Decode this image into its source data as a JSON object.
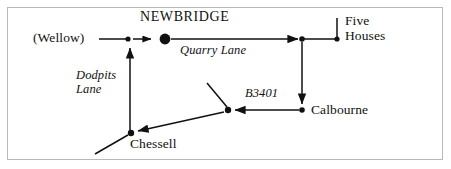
{
  "figure": {
    "border_color": "#b9b9b9",
    "ink_color": "#111111",
    "background_color": "#ffffff"
  },
  "places": {
    "wellow": "(Wellow)",
    "newbridge": "NEWBRIDGE",
    "five_houses_line1": "Five",
    "five_houses_line2": "Houses",
    "calbourne": "Calbourne",
    "chessell": "Chessell"
  },
  "roads": {
    "quarry_lane": "Quarry Lane",
    "dodpits_lane_line1": "Dodpits",
    "dodpits_lane_line2": "Lane",
    "b3401": "B3401"
  },
  "nodes": [
    {
      "name": "dodpits-junction",
      "x": 128,
      "y": 39,
      "r": 2.6
    },
    {
      "name": "newbridge-village",
      "x": 165,
      "y": 39,
      "r": 5.4
    },
    {
      "name": "five-houses-junction",
      "x": 302,
      "y": 39,
      "r": 2.8
    },
    {
      "name": "five-houses-terminus",
      "x": 337,
      "y": 39,
      "r": 2.6
    },
    {
      "name": "calbourne-node",
      "x": 302,
      "y": 111,
      "r": 2.8
    },
    {
      "name": "b3401-junction",
      "x": 228,
      "y": 110,
      "r": 3.0
    },
    {
      "name": "chessell-node",
      "x": 131,
      "y": 133,
      "r": 3.0
    }
  ],
  "edges": [
    {
      "name": "wellow-to-dodpits-junction",
      "from": "wellow-label",
      "to": "dodpits-junction",
      "arrow": false
    },
    {
      "name": "dodpits-junction-to-newbridge",
      "from": "dodpits-junction",
      "to": "newbridge-village",
      "arrow": true
    },
    {
      "name": "newbridge-to-five-houses-junction",
      "from": "newbridge-village",
      "to": "five-houses-junction",
      "arrow": true,
      "label": "Quarry Lane"
    },
    {
      "name": "five-houses-junction-to-terminus",
      "from": "five-houses-junction",
      "to": "five-houses-terminus",
      "arrow": false
    },
    {
      "name": "five-houses-terminus-tick",
      "from": "five-houses-terminus",
      "to": "tick-above",
      "arrow": false
    },
    {
      "name": "five-houses-junction-to-calbourne",
      "from": "five-houses-junction",
      "to": "calbourne-node",
      "arrow": true
    },
    {
      "name": "calbourne-to-b3401-junction",
      "from": "calbourne-node",
      "to": "b3401-junction",
      "arrow": true,
      "label": "B3401"
    },
    {
      "name": "b3401-junction-spur-north",
      "from": "b3401-junction",
      "to": "spur-north-end",
      "arrow": false
    },
    {
      "name": "b3401-junction-to-chessell",
      "from": "b3401-junction",
      "to": "chessell-node",
      "arrow": true
    },
    {
      "name": "chessell-spur-southwest",
      "from": "chessell-node",
      "to": "spur-southwest-end",
      "arrow": false
    },
    {
      "name": "chessell-to-dodpits-junction",
      "from": "chessell-node",
      "to": "dodpits-junction",
      "arrow": true,
      "label": "Dodpits Lane"
    }
  ]
}
